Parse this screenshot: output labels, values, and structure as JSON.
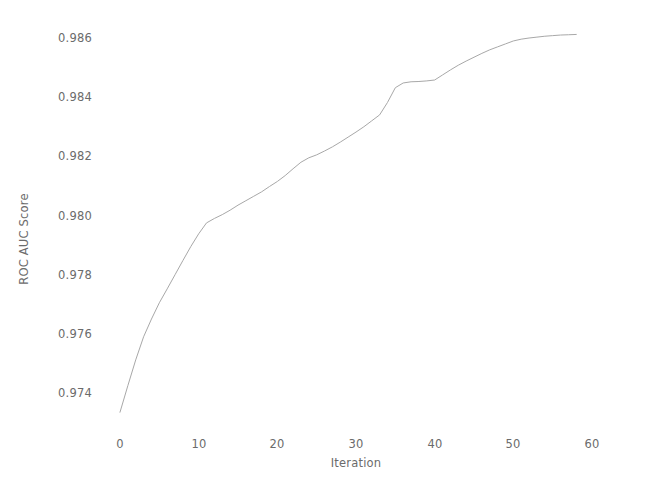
{
  "chart_data": {
    "type": "line",
    "title": "",
    "xlabel": "Iteration",
    "ylabel": "ROC AUC Score",
    "xlim": [
      -1.5,
      61
    ],
    "ylim": [
      0.97295,
      0.98635
    ],
    "xticks": [
      0,
      10,
      20,
      30,
      40,
      50,
      60
    ],
    "xtick_labels": [
      "0",
      "10",
      "20",
      "30",
      "40",
      "50",
      "60"
    ],
    "yticks": [
      0.974,
      0.976,
      0.978,
      0.98,
      0.982,
      0.984,
      0.986
    ],
    "ytick_labels": [
      "0.974",
      "0.976",
      "0.978",
      "0.980",
      "0.982",
      "0.984",
      "0.986"
    ],
    "grid": false,
    "legend": null,
    "line_color": "#a8a8a8",
    "line_width": 1.0,
    "series": [
      {
        "name": "ROC AUC Score",
        "x": [
          0,
          1,
          2,
          3,
          4,
          5,
          6,
          7,
          8,
          9,
          10,
          11,
          12,
          13,
          14,
          15,
          16,
          17,
          18,
          19,
          20,
          21,
          22,
          23,
          24,
          25,
          26,
          27,
          28,
          29,
          30,
          31,
          32,
          33,
          34,
          35,
          36,
          37,
          38,
          39,
          40,
          41,
          42,
          43,
          44,
          45,
          46,
          47,
          48,
          49,
          50,
          51,
          52,
          53,
          54,
          55,
          56,
          57,
          58
        ],
        "y": [
          0.97335,
          0.97425,
          0.97512,
          0.9759,
          0.9765,
          0.97705,
          0.97752,
          0.978,
          0.97848,
          0.97895,
          0.97938,
          0.97975,
          0.9799,
          0.98003,
          0.98018,
          0.98035,
          0.9805,
          0.98065,
          0.9808,
          0.98098,
          0.98115,
          0.98135,
          0.98158,
          0.9818,
          0.98195,
          0.98205,
          0.98218,
          0.98232,
          0.98248,
          0.98265,
          0.98282,
          0.983,
          0.9832,
          0.9834,
          0.98382,
          0.98432,
          0.98448,
          0.98452,
          0.98453,
          0.98455,
          0.98458,
          0.98475,
          0.98492,
          0.98508,
          0.98522,
          0.98535,
          0.98548,
          0.9856,
          0.9857,
          0.9858,
          0.9859,
          0.98596,
          0.986,
          0.98603,
          0.98606,
          0.98608,
          0.9861,
          0.98611,
          0.98612
        ]
      }
    ]
  }
}
